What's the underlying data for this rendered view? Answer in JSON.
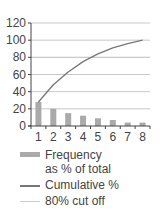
{
  "chart_data": {
    "type": "bar",
    "title": "",
    "xlabel": "",
    "ylabel": "",
    "ylim": [
      0,
      120
    ],
    "yticks": [
      0,
      20,
      40,
      60,
      80,
      100,
      120
    ],
    "categories": [
      "1",
      "2",
      "3",
      "4",
      "5",
      "6",
      "7",
      "8"
    ],
    "series": [
      {
        "name": "Frequency as % of total",
        "kind": "bar",
        "color": "#aaaaaa",
        "values": [
          28,
          20,
          15,
          12,
          9,
          7,
          4,
          4
        ]
      },
      {
        "name": "Cumulative %",
        "kind": "line",
        "color": "#777777",
        "values": [
          28,
          48,
          63,
          75,
          84,
          91,
          96,
          100
        ]
      },
      {
        "name": "80% cut off",
        "kind": "hline",
        "color": "#cccccc",
        "value": 80
      }
    ],
    "grid": true,
    "legend_position": "bottom"
  },
  "legend": {
    "items": [
      {
        "label": "Frequency\nas % of total"
      },
      {
        "label": "Cumulative %"
      },
      {
        "label": "80% cut off"
      }
    ]
  }
}
